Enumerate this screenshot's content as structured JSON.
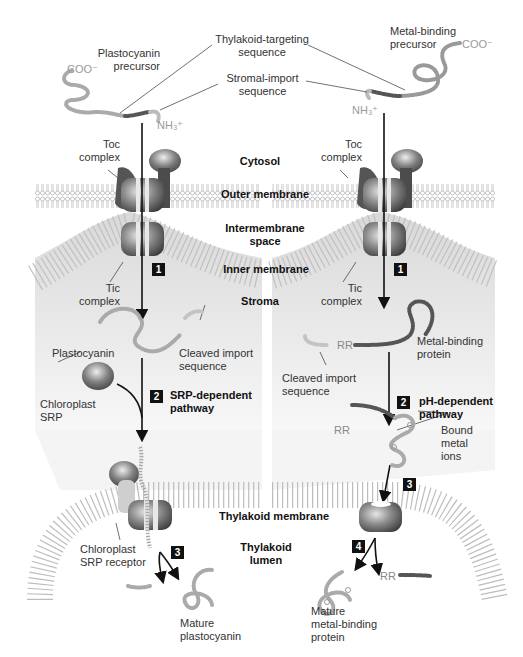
{
  "figure": {
    "compartments": {
      "cytosol": "Cytosol",
      "outer_membrane": "Outer membrane",
      "intermembrane_space": "Intermembrane\nspace",
      "inner_membrane": "Inner membrane",
      "stroma": "Stroma",
      "thylakoid_membrane": "Thylakoid membrane",
      "thylakoid_lumen": "Thylakoid\nlumen"
    },
    "shared_labels": {
      "thylakoid_targeting": "Thylakoid-targeting\nsequence",
      "stromal_import": "Stromal-import\nsequence"
    },
    "left_pathway": {
      "precursor": "Plastocyanin\nprecursor",
      "coo": "COO⁻",
      "nh3": "NH₃⁺",
      "toc": "Toc\ncomplex",
      "tic": "Tic\ncomplex",
      "step1": "1",
      "plastocyanin": "Plastocyanin",
      "cleaved": "Cleaved import\nsequence",
      "srp": "Chloroplast\nSRP",
      "step2": "2",
      "pathway2": "SRP-dependent\npathway",
      "srp_receptor": "Chloroplast\nSRP receptor",
      "step3": "3",
      "mature": "Mature\nplastocyanin"
    },
    "right_pathway": {
      "precursor": "Metal-binding\nprecursor",
      "coo": "COO⁻",
      "nh3": "NH₃⁺",
      "toc": "Toc\ncomplex",
      "tic": "Tic\ncomplex",
      "step1": "1",
      "protein": "Metal-binding\nprotein",
      "rr": "RR",
      "cleaved": "Cleaved import\nsequence",
      "step2": "2",
      "pathway2": "pH-dependent\npathway",
      "rr2": "RR",
      "metal_ions": "Bound\nmetal\nions",
      "step3": "3",
      "step4": "4",
      "rr3": "RR",
      "mature": "Mature\nmetal-binding\nprotein"
    },
    "colors": {
      "membrane": "#bdbdbd",
      "stroma_fill": "#e6e6e6",
      "protein_dark": "#555555",
      "protein_light": "#c8c8c8",
      "chain": "#a8a8a8",
      "arrow": "#111111",
      "step_badge": "#111111"
    }
  }
}
